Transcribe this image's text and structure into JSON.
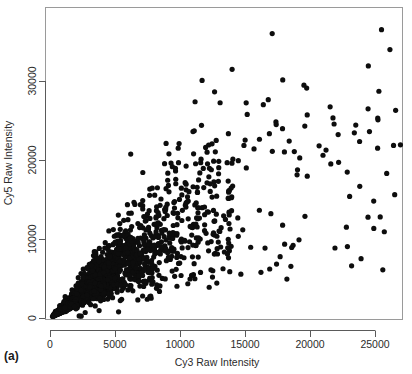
{
  "figure": {
    "panel_label": "(a)",
    "background_color": "#ffffff",
    "point_color": "#0d0d0d",
    "axis_color": "#5a5a5a",
    "box_color": "#9a9a9a"
  },
  "chart_data": {
    "type": "scatter",
    "title": "",
    "subtitle": "",
    "xlabel": "Cy3 Raw Intensity",
    "ylabel": "Cy5 Raw Intensity",
    "xlim": [
      -1200,
      28200
    ],
    "ylim": [
      -1400,
      38500
    ],
    "xticks": [
      0,
      5000,
      10000,
      15000,
      20000,
      25000
    ],
    "xticklabels": [
      "0",
      "5000",
      "10000",
      "15000",
      "20000",
      "25000"
    ],
    "yticks": [
      0,
      10000,
      20000,
      30000
    ],
    "yticklabels": [
      "0",
      "10000",
      "20000",
      "30000"
    ],
    "grid": false,
    "legend": null,
    "legend_position": "none",
    "marker": "filled-circle",
    "marker_size_px": 2.6,
    "annotations": [
      "(a)"
    ],
    "n_points": 2600,
    "generator": {
      "method": "lognormal-core-plus-outliers",
      "core_fraction": 0.93,
      "core_x_median": 2600,
      "core_x_sigma": 0.78,
      "slope": 1.02,
      "noise_sigma_base": 0.3,
      "outlier_count": 70,
      "outlier_x_range": [
        9000,
        27500
      ],
      "outlier_y_range": [
        4000,
        37000
      ],
      "seed": 20240517
    },
    "points": [
      [
        25500,
        36500
      ],
      [
        27300,
        29600
      ],
      [
        25300,
        28700
      ],
      [
        19600,
        24300
      ],
      [
        18400,
        22400
      ],
      [
        20700,
        21800
      ],
      [
        25200,
        21500
      ],
      [
        17100,
        21100
      ],
      [
        21000,
        20600
      ],
      [
        22200,
        19700
      ],
      [
        21600,
        19500
      ],
      [
        25900,
        18300
      ],
      [
        15100,
        19000
      ],
      [
        24900,
        14800
      ],
      [
        25400,
        12800
      ],
      [
        22800,
        11500
      ],
      [
        25600,
        6100
      ],
      [
        23200,
        6600
      ],
      [
        18700,
        9200
      ],
      [
        16900,
        6200
      ]
    ]
  }
}
